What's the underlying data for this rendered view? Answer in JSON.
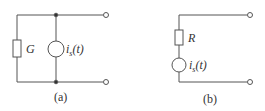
{
  "circuit_a": {
    "caption": "(a)",
    "element_label": "G",
    "source_label": "i",
    "source_sub": "s",
    "source_arg": "(t)"
  },
  "circuit_b": {
    "caption": "(b)",
    "element_label": "R",
    "source_label": "i",
    "source_sub": "s",
    "source_arg": "(t)"
  },
  "colors": {
    "wire": "#555555"
  }
}
